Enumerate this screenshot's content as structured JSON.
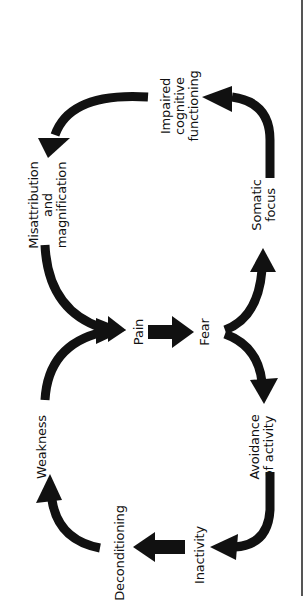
{
  "diagram": {
    "orientation": "rotated 90deg counterclockwise",
    "colors": {
      "arrow": "#111111",
      "text": "#111111",
      "border": "#555555",
      "background": "#ffffff"
    },
    "nodes": {
      "pain": "Pain",
      "fear": "Fear",
      "somatic_focus": "Somatic\nfocus",
      "impaired_cognitive": "Impaired\ncognitive\nfunctioning",
      "misattribution": "Misattribution\nand\nmagnification",
      "avoidance": "Avoidance\nof activity",
      "inactivity": "Inactivity",
      "deconditioning": "Deconditioning",
      "weakness": "Weakness"
    },
    "edges": [
      {
        "from": "Pain",
        "to": "Fear"
      },
      {
        "from": "Fear",
        "to": "Somatic focus"
      },
      {
        "from": "Fear",
        "to": "Avoidance of activity"
      },
      {
        "from": "Somatic focus",
        "to": "Impaired cognitive functioning"
      },
      {
        "from": "Impaired cognitive functioning",
        "to": "Misattribution and magnification"
      },
      {
        "from": "Misattribution and magnification",
        "to": "Pain"
      },
      {
        "from": "Avoidance of activity",
        "to": "Inactivity"
      },
      {
        "from": "Inactivity",
        "to": "Deconditioning"
      },
      {
        "from": "Deconditioning",
        "to": "Weakness"
      },
      {
        "from": "Weakness",
        "to": "Pain"
      }
    ]
  }
}
